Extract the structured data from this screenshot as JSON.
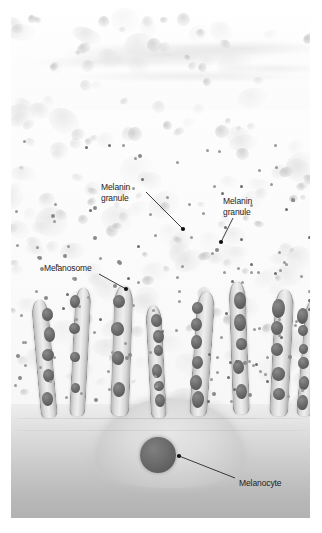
{
  "figure": {
    "type": "histology-illustration",
    "palette": {
      "background": "#ffffff",
      "epidermis": "#fbfbfb",
      "dermis_light": "#eeeeee",
      "dermis_dark": "#b2b2b2",
      "melanosome": "#5a5a5a",
      "granule": "#9a9a9a",
      "label_text": "#1d1d1d",
      "leader_line": "#1d1d1d"
    }
  },
  "labels": [
    {
      "id": "melanin-granule-left",
      "line1": "Melanin",
      "line2": "granule",
      "text": "Melanin granule",
      "x": 90,
      "y": 182,
      "leader": {
        "x1": 135,
        "y1": 192,
        "x2": 172,
        "y2": 229
      }
    },
    {
      "id": "melanin-granule-right",
      "line1": "Melanin",
      "line2": "granule",
      "text": "Melanin granule",
      "x": 212,
      "y": 196,
      "leader": {
        "x1": 222,
        "y1": 218,
        "x2": 210,
        "y2": 242
      }
    },
    {
      "id": "melanosome",
      "line1": "Melanosome",
      "line2": "",
      "text": "Melanosome",
      "x": 33,
      "y": 263,
      "leader": {
        "x1": 88,
        "y1": 274,
        "x2": 115,
        "y2": 289
      }
    },
    {
      "id": "melanocyte",
      "line1": "Melanocyte",
      "line2": "",
      "text": "Melanocyte",
      "x": 228,
      "y": 478,
      "leader": {
        "x1": 224,
        "y1": 478,
        "x2": 168,
        "y2": 456
      }
    }
  ],
  "structures": {
    "melanocyte_nucleus": {
      "cx": 147,
      "cy": 455,
      "r": 18
    },
    "dendrite_count": 7,
    "melanosome_count": 34,
    "granule_count": 190
  }
}
